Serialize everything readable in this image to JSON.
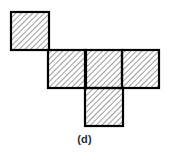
{
  "figure": {
    "label": "(d)",
    "kind": "hexomino-net",
    "cell_size": 38,
    "stroke_width": 2,
    "colors": {
      "stroke": "#000000",
      "fill": "#ffffff",
      "hatch": "#4a4a4a",
      "caption": "#2b2b2b",
      "background": "#ffffff"
    },
    "hatch": {
      "style": "diagonal-45-up",
      "spacing": 4,
      "line_width": 1
    },
    "grid": {
      "origin_x": 11,
      "origin_y": 12,
      "columns": 4,
      "rows": 3
    },
    "cells": [
      {
        "name": "cell-r0c0",
        "row": 0,
        "col": 0,
        "x": 11,
        "y": 12,
        "w": 38,
        "h": 38
      },
      {
        "name": "cell-r1c1",
        "row": 1,
        "col": 1,
        "x": 48,
        "y": 50,
        "w": 38,
        "h": 38
      },
      {
        "name": "cell-r1c2",
        "row": 1,
        "col": 2,
        "x": 85,
        "y": 50,
        "w": 38,
        "h": 38
      },
      {
        "name": "cell-r1c3",
        "row": 1,
        "col": 3,
        "x": 122,
        "y": 50,
        "w": 37,
        "h": 38
      },
      {
        "name": "cell-r2c2",
        "row": 2,
        "col": 2,
        "x": 85,
        "y": 88,
        "w": 38,
        "h": 38
      }
    ],
    "cell_count": 5
  }
}
